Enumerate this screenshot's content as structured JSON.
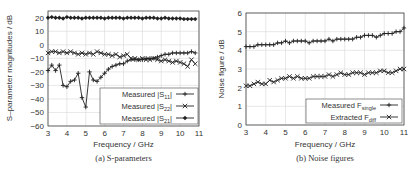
{
  "chart_data": [
    {
      "type": "line",
      "title": "",
      "caption": "(a) S-parameters",
      "xlabel": "Frequency / GHz",
      "ylabel": "S–parameter magnitudes / dB",
      "xlim": [
        3,
        11
      ],
      "ylim": [
        -60,
        25
      ],
      "xticks": [
        3,
        4,
        5,
        6,
        7,
        8,
        9,
        10,
        11
      ],
      "yticks": [
        20,
        10,
        0,
        -10,
        -20,
        -30,
        -40,
        -50,
        -60
      ],
      "grid": true,
      "legend_position": "lower right",
      "x": [
        3.0,
        3.2,
        3.4,
        3.6,
        3.8,
        4.0,
        4.2,
        4.4,
        4.6,
        4.8,
        5.0,
        5.2,
        5.4,
        5.6,
        5.8,
        6.0,
        6.2,
        6.4,
        6.6,
        6.8,
        7.0,
        7.2,
        7.4,
        7.6,
        7.8,
        8.0,
        8.2,
        8.4,
        8.6,
        8.8,
        9.0,
        9.2,
        9.4,
        9.6,
        9.8,
        10.0,
        10.2,
        10.4,
        10.6,
        10.8
      ],
      "series": [
        {
          "name": "Measured |S11|",
          "legend_main": "Measured |S",
          "legend_sub": "11",
          "marker": "+",
          "values": [
            -19,
            -15,
            -19,
            -15,
            -30,
            -31,
            -27,
            -26,
            -21,
            -39,
            -46,
            -20,
            -26,
            -27,
            -24,
            -21,
            -18,
            -16,
            -15,
            -14,
            -14,
            -12,
            -11,
            -11,
            -11,
            -11,
            -10,
            -10,
            -10,
            -9,
            -8,
            -7,
            -7,
            -6,
            -6,
            -6,
            -6,
            -6,
            -5,
            -6
          ]
        },
        {
          "name": "Measured |S22|",
          "legend_main": "Measured |S",
          "legend_sub": "22",
          "marker": "x",
          "values": [
            -6,
            -5,
            -5,
            -6,
            -5,
            -6,
            -5,
            -6,
            -7,
            -6,
            -7,
            -6,
            -7,
            -5,
            -6,
            -7,
            -7,
            -8,
            -7,
            -9,
            -8,
            -7,
            -10,
            -10,
            -11,
            -10,
            -11,
            -11,
            -10,
            -11,
            -12,
            -11,
            -12,
            -13,
            -12,
            -13,
            -14,
            -16,
            -11,
            -14
          ]
        },
        {
          "name": "Measured |S21|",
          "legend_main": "Measured |S",
          "legend_sub": "21",
          "marker": "diamond",
          "values": [
            20,
            20.5,
            20,
            20,
            19.5,
            20.5,
            20,
            20,
            20,
            19.5,
            20,
            20,
            20,
            20,
            20,
            19.5,
            20,
            20,
            20,
            20,
            19.5,
            20,
            20,
            20,
            20,
            19.5,
            20,
            20,
            20,
            19.5,
            19.5,
            20,
            19.5,
            19.5,
            19.5,
            19.5,
            19,
            19,
            19,
            19
          ]
        }
      ]
    },
    {
      "type": "line",
      "title": "",
      "caption": "(b) Noise figures",
      "xlabel": "Frequency / GHz",
      "ylabel": "Noise figure / dB",
      "xlim": [
        3,
        11
      ],
      "ylim": [
        0,
        6
      ],
      "xticks": [
        3,
        4,
        5,
        6,
        7,
        8,
        9,
        10,
        11
      ],
      "yticks": [
        0,
        1,
        2,
        3,
        4,
        5,
        6
      ],
      "grid": true,
      "legend_position": "lower right",
      "x": [
        3.0,
        3.2,
        3.4,
        3.6,
        3.8,
        4.0,
        4.2,
        4.4,
        4.6,
        4.8,
        5.0,
        5.2,
        5.4,
        5.6,
        5.8,
        6.0,
        6.2,
        6.4,
        6.6,
        6.8,
        7.0,
        7.2,
        7.4,
        7.6,
        7.8,
        8.0,
        8.2,
        8.4,
        8.6,
        8.8,
        9.0,
        9.2,
        9.4,
        9.6,
        9.8,
        10.0,
        10.2,
        10.4,
        10.6,
        10.8,
        11.0
      ],
      "series": [
        {
          "name": "Measured F_single",
          "legend_main": "Measured F",
          "legend_sub": "single",
          "marker": "+",
          "values": [
            4.2,
            4.2,
            4.2,
            4.3,
            4.3,
            4.3,
            4.3,
            4.3,
            4.4,
            4.4,
            4.5,
            4.4,
            4.5,
            4.5,
            4.5,
            4.5,
            4.4,
            4.5,
            4.5,
            4.5,
            4.5,
            4.6,
            4.5,
            4.6,
            4.6,
            4.6,
            4.6,
            4.6,
            4.7,
            4.7,
            4.8,
            4.8,
            4.8,
            4.7,
            4.8,
            4.9,
            4.9,
            4.9,
            5.0,
            5.0,
            5.2
          ]
        },
        {
          "name": "Extracted F_diff",
          "legend_main": "Extracted F",
          "legend_sub": "diff",
          "marker": "x",
          "values": [
            2.1,
            2.1,
            2.2,
            2.3,
            2.2,
            2.2,
            2.4,
            2.3,
            2.4,
            2.5,
            2.5,
            2.6,
            2.5,
            2.6,
            2.5,
            2.5,
            2.5,
            2.6,
            2.6,
            2.6,
            2.6,
            2.7,
            2.6,
            2.7,
            2.8,
            2.7,
            2.7,
            2.8,
            2.8,
            2.8,
            2.7,
            2.8,
            2.8,
            2.8,
            2.9,
            2.9,
            2.8,
            2.8,
            2.9,
            3.0,
            3.0
          ]
        }
      ]
    }
  ]
}
